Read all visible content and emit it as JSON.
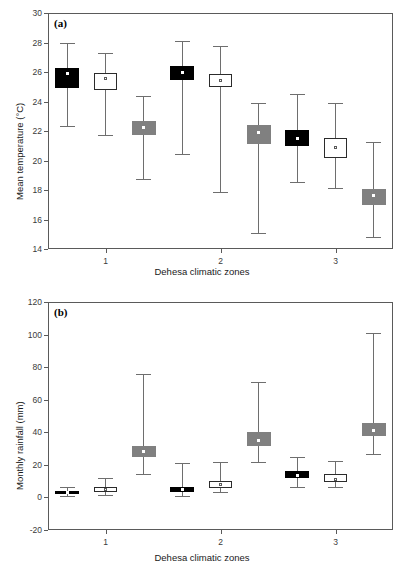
{
  "figure": {
    "panels": [
      {
        "key": "a",
        "label": "(a)",
        "xlabel": "Dehesa climatic zones",
        "ylabel": "Mean temperature (°C)"
      },
      {
        "key": "b",
        "label": "(b)",
        "xlabel": "Dehesa climatic zones",
        "ylabel": "Monthly rainfall (mm)"
      }
    ]
  },
  "chart_data": [
    {
      "type": "box",
      "panel": "(a)",
      "title": "",
      "xlabel": "Dehesa climatic zones",
      "ylabel": "Mean temperature (°C)",
      "ylim": [
        14,
        30
      ],
      "yticks": [
        14,
        16,
        18,
        20,
        22,
        24,
        26,
        28,
        30
      ],
      "xticklabels": [
        "1",
        "2",
        "3"
      ],
      "grid": false,
      "legend": "none",
      "series_styles": [
        {
          "name": "black",
          "fill": "#000000",
          "border": "#000000"
        },
        {
          "name": "white",
          "fill": "#ffffff",
          "border": "#2b2b2b"
        },
        {
          "name": "gray",
          "fill": "#808080",
          "border": "#808080"
        }
      ],
      "boxes": [
        {
          "zone": "1",
          "style": "black",
          "whisker_low": 22.25,
          "q1": 24.9,
          "mean": 25.9,
          "q3": 26.25,
          "whisker_high": 27.95
        },
        {
          "zone": "1",
          "style": "white",
          "whisker_low": 21.65,
          "q1": 24.8,
          "mean": 25.55,
          "q3": 25.95,
          "whisker_high": 27.3
        },
        {
          "zone": "1",
          "style": "gray",
          "whisker_low": 18.7,
          "q1": 21.75,
          "mean": 22.25,
          "q3": 22.65,
          "whisker_high": 24.4
        },
        {
          "zone": "2",
          "style": "black",
          "whisker_low": 20.4,
          "q1": 25.45,
          "mean": 25.95,
          "q3": 26.4,
          "whisker_high": 28.1
        },
        {
          "zone": "2",
          "style": "white",
          "whisker_low": 17.8,
          "q1": 25.0,
          "mean": 25.45,
          "q3": 25.85,
          "whisker_high": 27.75
        },
        {
          "zone": "2",
          "style": "gray",
          "whisker_low": 15.0,
          "q1": 21.1,
          "mean": 21.9,
          "q3": 22.4,
          "whisker_high": 23.9
        },
        {
          "zone": "3",
          "style": "black",
          "whisker_low": 18.5,
          "q1": 20.95,
          "mean": 21.5,
          "q3": 22.1,
          "whisker_high": 24.5
        },
        {
          "zone": "3",
          "style": "white",
          "whisker_low": 18.05,
          "q1": 20.15,
          "mean": 20.85,
          "q3": 21.5,
          "whisker_high": 23.9
        },
        {
          "zone": "3",
          "style": "gray",
          "whisker_low": 14.75,
          "q1": 16.95,
          "mean": 17.6,
          "q3": 18.05,
          "whisker_high": 21.25
        }
      ]
    },
    {
      "type": "box",
      "panel": "(b)",
      "title": "",
      "xlabel": "Dehesa climatic zones",
      "ylabel": "Monthly rainfall (mm)",
      "ylim": [
        -20,
        120
      ],
      "yticks": [
        -20,
        0,
        20,
        40,
        60,
        80,
        100,
        120
      ],
      "xticklabels": [
        "1",
        "2",
        "3"
      ],
      "grid": false,
      "legend": "none",
      "series_styles": [
        {
          "name": "black",
          "fill": "#000000",
          "border": "#000000"
        },
        {
          "name": "white",
          "fill": "#ffffff",
          "border": "#2b2b2b"
        },
        {
          "name": "gray",
          "fill": "#808080",
          "border": "#808080"
        }
      ],
      "boxes": [
        {
          "zone": "1",
          "style": "black",
          "whisker_low": 0.5,
          "q1": 2.0,
          "mean": 3.0,
          "q3": 4.2,
          "whisker_high": 6.5
        },
        {
          "zone": "1",
          "style": "white",
          "whisker_low": 1.0,
          "q1": 3.2,
          "mean": 5.0,
          "q3": 6.5,
          "whisker_high": 12.0
        },
        {
          "zone": "1",
          "style": "gray",
          "whisker_low": 14.0,
          "q1": 25.0,
          "mean": 28.0,
          "q3": 31.5,
          "whisker_high": 76.0
        },
        {
          "zone": "2",
          "style": "black",
          "whisker_low": 0.0,
          "q1": 3.5,
          "mean": 5.0,
          "q3": 6.5,
          "whisker_high": 21.0
        },
        {
          "zone": "2",
          "style": "white",
          "whisker_low": 3.0,
          "q1": 6.0,
          "mean": 8.0,
          "q3": 10.0,
          "whisker_high": 22.0
        },
        {
          "zone": "2",
          "style": "gray",
          "whisker_low": 21.0,
          "q1": 31.5,
          "mean": 35.0,
          "q3": 40.0,
          "whisker_high": 71.0
        },
        {
          "zone": "3",
          "style": "black",
          "whisker_low": 6.0,
          "q1": 12.0,
          "mean": 13.5,
          "q3": 16.0,
          "whisker_high": 25.0
        },
        {
          "zone": "3",
          "style": "white",
          "whisker_low": 6.0,
          "q1": 9.5,
          "mean": 11.0,
          "q3": 14.5,
          "whisker_high": 22.5
        },
        {
          "zone": "3",
          "style": "gray",
          "whisker_low": 26.0,
          "q1": 37.5,
          "mean": 41.0,
          "q3": 46.0,
          "whisker_high": 101.0
        }
      ]
    }
  ]
}
